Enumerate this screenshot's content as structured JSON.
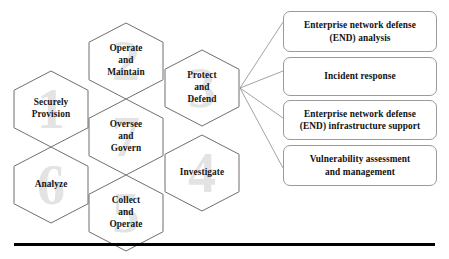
{
  "diagram": {
    "hexagons": [
      {
        "id": "securely-provision",
        "number": "1",
        "lines": [
          "Securely",
          "Provision"
        ]
      },
      {
        "id": "operate-and-maintain",
        "number": "2",
        "lines": [
          "Operate",
          "and",
          "Maintain"
        ]
      },
      {
        "id": "protect-and-defend",
        "number": "3",
        "lines": [
          "Protect",
          "and",
          "Defend"
        ]
      },
      {
        "id": "investigate",
        "number": "4",
        "lines": [
          "Investigate"
        ]
      },
      {
        "id": "collect-and-operate",
        "number": "5",
        "lines": [
          "Collect",
          "and",
          "Operate"
        ]
      },
      {
        "id": "analyze",
        "number": "6",
        "lines": [
          "Analyze"
        ]
      },
      {
        "id": "oversee-and-govern",
        "number": "7",
        "lines": [
          "Oversee",
          "and",
          "Govern"
        ]
      }
    ],
    "specialty_boxes": [
      {
        "id": "end-analysis",
        "lines": [
          "Enterprise network defense",
          "(END) analysis"
        ]
      },
      {
        "id": "incident-response",
        "lines": [
          "Incident response"
        ]
      },
      {
        "id": "end-infrastructure-support",
        "lines": [
          "Enterprise network defense",
          "(END) infrastructure support"
        ]
      },
      {
        "id": "vulnerability-assessment",
        "lines": [
          "Vulnerability assessment",
          "and management"
        ]
      }
    ],
    "connector_source": "protect-and-defend",
    "colors": {
      "hex_outline": "#6f6f6f",
      "hex_watermark": "#e3e3e3",
      "box_outline": "#9a9a9a",
      "connector": "#8c8c8c",
      "text": "#111111",
      "rule": "#000000",
      "background": "#ffffff"
    }
  }
}
